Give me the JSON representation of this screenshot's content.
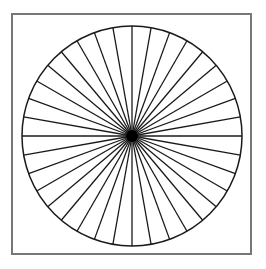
{
  "figure": {
    "type": "radial-spoke-wheel",
    "spoke_count": 36,
    "spoke_angle_step_deg": 10,
    "colors": {
      "background": "#ffffff",
      "frame": "#777777",
      "lines": "#1a1a1a",
      "hub": "#000000"
    }
  }
}
